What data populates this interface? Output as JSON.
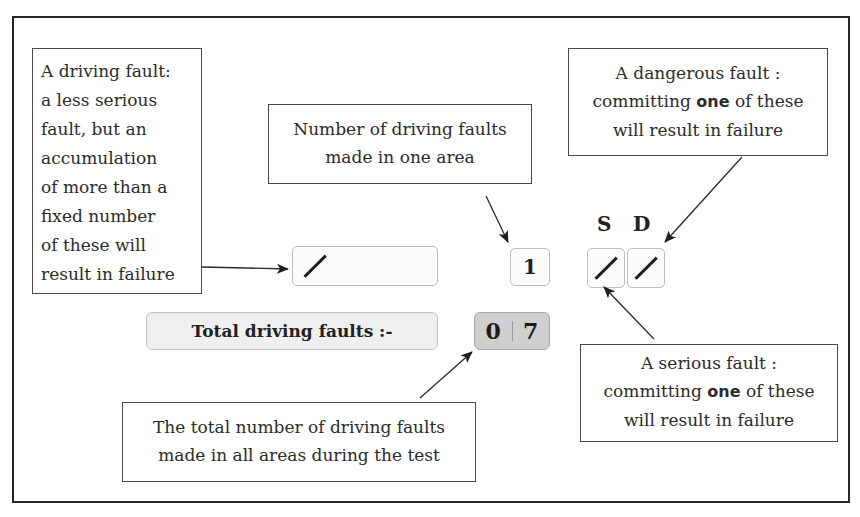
{
  "diagram": {
    "callouts": {
      "driving_fault": {
        "lines": [
          "A driving fault:",
          "a less serious",
          "fault, but an",
          "accumulation",
          "of more than a",
          "fixed number",
          "of these will",
          "result in failure"
        ]
      },
      "faults_in_area": {
        "line1": "Number of driving faults",
        "line2": "made in one area"
      },
      "dangerous_fault": {
        "line1": "A dangerous fault :",
        "line2_pre": "committing ",
        "line2_bold": "one",
        "line2_post": " of these",
        "line3": "will result in failure"
      },
      "serious_fault": {
        "line1": "A serious fault :",
        "line2_pre": "committing ",
        "line2_bold": "one",
        "line2_post": " of these",
        "line3": "will result in failure"
      },
      "total_faults": {
        "line1": "The total number of driving faults",
        "line2": "made in all areas during the test"
      }
    },
    "marking_sheet": {
      "driving_fault_mark": "/",
      "area_fault_count": "1",
      "serious_label": "S",
      "dangerous_label": "D",
      "serious_mark": "/",
      "dangerous_mark": "/",
      "total_label": "Total driving faults :-",
      "total_digits": [
        "0",
        "7"
      ]
    },
    "colors": {
      "frame": "#262626",
      "box_border": "#bdbdbd",
      "total_label_bg": "#efefef",
      "total_value_bg": "#cfcfcf"
    }
  }
}
